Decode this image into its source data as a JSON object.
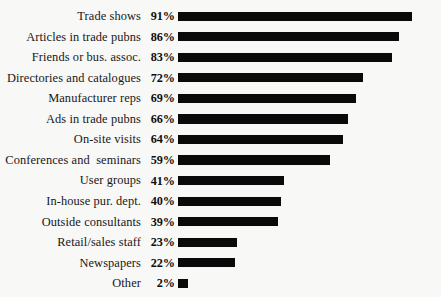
{
  "chart_data": {
    "type": "bar",
    "orientation": "horizontal",
    "title": "",
    "subtitle": "",
    "xlabel": "",
    "ylabel": "",
    "xlim": [
      0,
      100
    ],
    "grid": false,
    "legend": false,
    "value_suffix": "%",
    "bar_color": "#0a0a0a",
    "background_color": "#f8f8f7",
    "categories": [
      "Trade shows",
      "Articles in trade pubns",
      "Friends or bus. assoc.",
      "Directories and catalogues",
      "Manufacturer reps",
      "Ads in trade pubns",
      "On-site visits",
      "Conferences and  seminars",
      "User groups",
      "In-house pur. dept.",
      "Outside consultants",
      "Retail/sales staff",
      "Newspapers",
      "Other"
    ],
    "values": [
      91,
      86,
      83,
      72,
      69,
      66,
      64,
      59,
      41,
      40,
      39,
      23,
      22,
      2
    ],
    "value_labels": [
      "91%",
      "86%",
      "83%",
      "72%",
      "69%",
      "66%",
      "64%",
      "59%",
      "41%",
      "40%",
      "39%",
      "23%",
      "22%",
      "2%"
    ]
  }
}
